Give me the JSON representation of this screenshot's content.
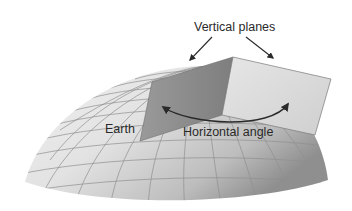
{
  "diagram": {
    "labels": {
      "vertical_planes": "Vertical planes",
      "earth": "Earth",
      "horizontal_angle": "Horizontal angle"
    },
    "colors": {
      "background": "#ffffff",
      "dome_light": "#ececec",
      "dome_dark": "#9a9a9a",
      "grid": "#8f8f8f",
      "left_plane_light": "#8e8e8e",
      "left_plane_dark": "#b8b8b8",
      "right_plane": "#dcdcdc",
      "arrow": "#2a2a2a",
      "text": "#2a2a2a"
    }
  }
}
